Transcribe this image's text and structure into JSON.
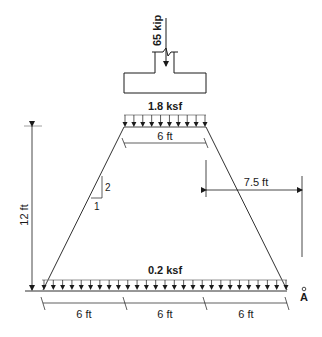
{
  "diagram": {
    "type": "footing stress distribution (2:1 method)",
    "column_load": {
      "label": "65 kip",
      "value": 65,
      "unit": "kip"
    },
    "top_pressure": {
      "label": "1.8 ksf",
      "value": 1.8,
      "unit": "ksf",
      "arrow_count": 10
    },
    "bottom_pressure": {
      "label": "0.2 ksf",
      "value": 0.2,
      "unit": "ksf",
      "arrow_count": 27
    },
    "dimensions": {
      "footing_width": {
        "label": "6 ft"
      },
      "depth": {
        "label": "12 ft"
      },
      "offset_to_A": {
        "label": "7.5 ft"
      },
      "bottom_left": {
        "label": "6 ft"
      },
      "bottom_middle": {
        "label": "6 ft"
      },
      "bottom_right": {
        "label": "6 ft"
      }
    },
    "slope": {
      "rise_label": "2",
      "run_label": "1"
    },
    "point": {
      "label": "A"
    }
  },
  "colors": {
    "line": "#1a1a1a",
    "background": "#ffffff"
  }
}
